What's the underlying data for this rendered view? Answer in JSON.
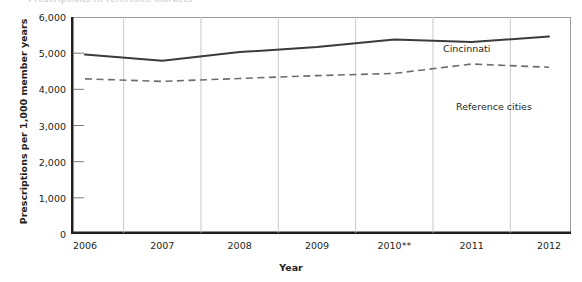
{
  "title_remnant": "    Prescriptions ... reference markets",
  "axes": {
    "xlabel": "Year",
    "ylabel": "Prescriptions per 1,000 member years"
  },
  "chart_data": {
    "type": "line",
    "title": "",
    "xlabel": "Year",
    "ylabel": "Prescriptions per 1,000 member years",
    "categories": [
      "2006",
      "2007",
      "2008",
      "2009",
      "2010**",
      "2011",
      "2012"
    ],
    "x_tick_labels": [
      "2006",
      "2007",
      "2008",
      "2009",
      "2010**",
      "2011",
      "2012"
    ],
    "y_tick_labels": [
      "0",
      "1,000",
      "2,000",
      "3,000",
      "4,000",
      "5,000",
      "6,000"
    ],
    "y_ticks": [
      0,
      1000,
      2000,
      3000,
      4000,
      5000,
      6000
    ],
    "ylim": [
      0,
      6000
    ],
    "grid": false,
    "legend_position": "inline-annotation",
    "series": [
      {
        "name": "Cincinnati",
        "style": "solid",
        "color": "#3b3b3b",
        "values": [
          4960,
          4790,
          5030,
          5170,
          5380,
          5310,
          5460
        ]
      },
      {
        "name": "Reference cities",
        "style": "dashed",
        "color": "#6d6d6d",
        "values": [
          4290,
          4220,
          4300,
          4380,
          4440,
          4700,
          4610
        ]
      }
    ],
    "annotations": [
      {
        "text": "Cincinnati",
        "series": "Cincinnati"
      },
      {
        "text": "Reference cities",
        "series": "Reference cities"
      }
    ],
    "footnote_marker": "**"
  }
}
